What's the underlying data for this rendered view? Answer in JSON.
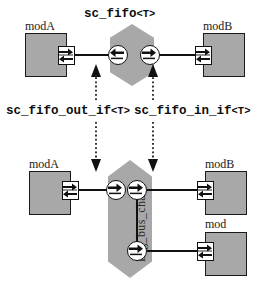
{
  "diagram": {
    "title_top": "sc_fifo",
    "title_top_tpl": "<T>",
    "caption_left": "sc_fifo_out_if",
    "caption_left_tpl": "<T>",
    "caption_right": "sc_fifo_in_if",
    "caption_right_tpl": "<T>",
    "channel_bottom_label": "Big_bus_chan"
  },
  "top": {
    "module_left": "modA",
    "module_right": "modB"
  },
  "bottom": {
    "module_left": "modA",
    "module_right_1": "modB",
    "module_right_2": "mod",
    "module_right_2_sub": "C"
  },
  "icons": {
    "port": "port-double-arrow-icon",
    "iface_out": "interface-left-arrow-icon",
    "iface_in": "interface-right-arrow-icon"
  },
  "colors": {
    "fill_gray": "#a8a8a8",
    "stroke_black": "#111111",
    "background": "#ffffff"
  }
}
